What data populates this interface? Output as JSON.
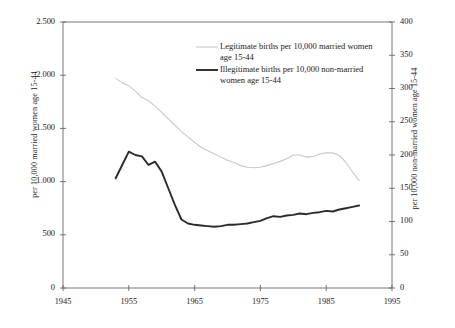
{
  "chart_data": {
    "type": "line",
    "title": "",
    "xlabel": "",
    "ylabel": "per 10,000 married women age 15-44",
    "ylabel_right": "per 10,000 non-married women age 15-44",
    "xlim": [
      1945,
      1995
    ],
    "ylim": [
      0,
      2500
    ],
    "ylim_right": [
      0,
      400
    ],
    "xticks": [
      1945,
      1955,
      1965,
      1975,
      1985,
      1995
    ],
    "xtick_labels": [
      "1945",
      "1955",
      "1965",
      "1975",
      "1985",
      "1995"
    ],
    "yticks": [
      0,
      500,
      1000,
      1500,
      2000,
      2500
    ],
    "ytick_labels": [
      "0",
      "500",
      "1.000",
      "1.500",
      "2.000",
      "2.500"
    ],
    "yticks_right": [
      0,
      50,
      100,
      150,
      200,
      250,
      300,
      350,
      400
    ],
    "ytick_labels_right": [
      "0",
      "50",
      "100",
      "150",
      "200",
      "250",
      "300",
      "350",
      "400"
    ],
    "grid": false,
    "legend_position": "upper-right-inside",
    "series": [
      {
        "name": "Legitimate births per 10,000 married women age 15-44",
        "axis": "left",
        "color": "#c8c8c8",
        "width": 1.1,
        "x": [
          1953,
          1954,
          1955,
          1956,
          1957,
          1958,
          1959,
          1960,
          1961,
          1962,
          1963,
          1964,
          1965,
          1966,
          1967,
          1968,
          1969,
          1970,
          1971,
          1972,
          1973,
          1974,
          1975,
          1976,
          1977,
          1978,
          1979,
          1980,
          1981,
          1982,
          1983,
          1984,
          1985,
          1986,
          1987,
          1988,
          1989,
          1990
        ],
        "values": [
          1970,
          1930,
          1900,
          1850,
          1790,
          1760,
          1710,
          1650,
          1590,
          1530,
          1470,
          1420,
          1370,
          1320,
          1290,
          1260,
          1230,
          1200,
          1180,
          1150,
          1135,
          1130,
          1135,
          1150,
          1170,
          1190,
          1215,
          1250,
          1250,
          1230,
          1235,
          1260,
          1270,
          1270,
          1245,
          1180,
          1090,
          1010
        ]
      },
      {
        "name": "Illegitimate births per 10,000 non-married women age 15-44",
        "axis": "right",
        "color": "#2b2b2b",
        "width": 1.9,
        "x": [
          1953,
          1954,
          1955,
          1956,
          1957,
          1958,
          1959,
          1960,
          1961,
          1962,
          1963,
          1964,
          1965,
          1966,
          1967,
          1968,
          1969,
          1970,
          1971,
          1972,
          1973,
          1974,
          1975,
          1976,
          1977,
          1978,
          1979,
          1980,
          1981,
          1982,
          1983,
          1984,
          1985,
          1986,
          1987,
          1988,
          1989,
          1990
        ],
        "values": [
          165,
          185,
          205,
          200,
          198,
          185,
          190,
          175,
          150,
          125,
          103,
          97,
          95,
          94,
          93,
          92,
          93,
          95,
          95,
          96,
          97,
          99,
          101,
          105,
          108,
          107,
          109,
          110,
          112,
          111,
          113,
          114,
          116,
          115,
          118,
          120,
          122,
          124
        ]
      }
    ],
    "legend": [
      {
        "label": "Legitimate births per 10,000 married women age 15-44",
        "color": "#c8c8c8",
        "swatch_width": 1.1
      },
      {
        "label": "Illegitimate births per 10,000 non-married women age 15-44",
        "color": "#2b2b2b",
        "swatch_width": 1.9
      }
    ],
    "frame": {
      "color": "#666666",
      "left": 63,
      "right": 392,
      "top": 22,
      "bottom": 288
    }
  }
}
